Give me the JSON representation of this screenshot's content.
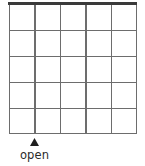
{
  "figure": {
    "title": "",
    "label": "open",
    "marker_icon": "up-triangle-icon",
    "colors": {
      "grid_line": "#6d6d6d",
      "open_edge": "#3a3a3a",
      "cell_fill": "#ffffff",
      "text": "#2b2b2b",
      "background": "#ffffff"
    }
  },
  "grid": {
    "columns": 5,
    "rows": 5,
    "cells": [
      [
        "",
        "",
        "",
        "",
        ""
      ],
      [
        "",
        "",
        "",
        "",
        ""
      ],
      [
        "",
        "",
        "",
        "",
        ""
      ],
      [
        "",
        "",
        "",
        "",
        ""
      ],
      [
        "",
        "",
        "",
        "",
        ""
      ]
    ]
  },
  "annotations": {
    "open_boundary_edge": "top",
    "marker_label": "open",
    "marker_points_to": "bottom edge at first interior column line"
  }
}
